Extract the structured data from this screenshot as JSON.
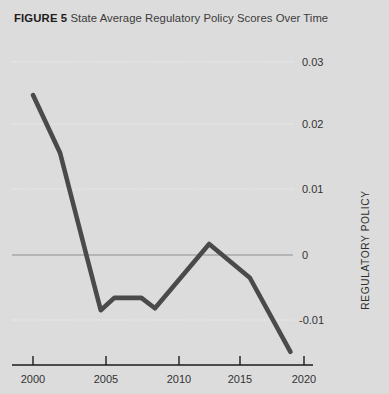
{
  "figure": {
    "label": "FIGURE 5",
    "caption": "State Average Regulatory Policy Scores Over Time"
  },
  "colors": {
    "background": "#dcdcdc",
    "line": "#4a4a4a",
    "axis": "#1c1c1c",
    "gridline": "#f1f1f1",
    "zeroline": "#8e8e8e",
    "text": "#333333"
  },
  "axes": {
    "y_title": "REGULATORY POLICY",
    "y_ticks": [
      "0.03",
      "0.02",
      "0.01",
      "0",
      "-0.01"
    ],
    "x_ticks": [
      "2000",
      "2005",
      "2010",
      "2015",
      "2020"
    ]
  },
  "chart_data": {
    "type": "line",
    "title": "State Average Regulatory Policy Scores Over Time",
    "xlabel": "",
    "ylabel": "REGULATORY POLICY",
    "xlim": [
      2000,
      2020
    ],
    "ylim": [
      -0.016,
      0.031
    ],
    "grid": true,
    "legend": null,
    "xticks": [
      2000,
      2005,
      2010,
      2015,
      2020
    ],
    "yticks": [
      0.03,
      0.02,
      0.01,
      0,
      -0.01
    ],
    "ytick_labels": [
      "0.03",
      "0.02",
      "0.01",
      "0",
      "-0.01"
    ],
    "zero_reference_line": 0,
    "series": [
      {
        "name": "State average regulatory policy score",
        "x": [
          2000,
          2002,
          2004,
          2005,
          2006,
          2008,
          2009,
          2013,
          2016,
          2019
        ],
        "values": [
          0.0246,
          0.0157,
          -0.0005,
          -0.0085,
          -0.0066,
          -0.0066,
          -0.0082,
          0.0017,
          -0.0035,
          -0.0149
        ]
      }
    ]
  }
}
